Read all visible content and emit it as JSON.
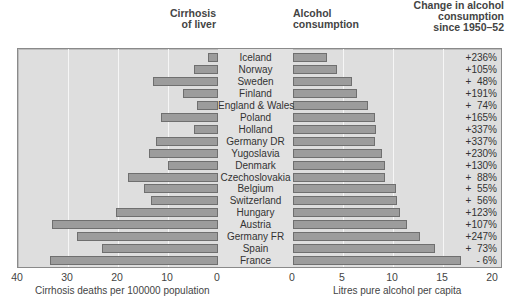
{
  "chart_data": {
    "type": "bar",
    "categories": [
      "Iceland",
      "Norway",
      "Sweden",
      "Finland",
      "England & Wales",
      "Poland",
      "Holland",
      "Germany DR",
      "Yugoslavia",
      "Denmark",
      "Czechoslovakia",
      "Belgium",
      "Switzerland",
      "Hungary",
      "Austria",
      "Germany FR",
      "Spain",
      "France"
    ],
    "series": [
      {
        "name": "Cirrhosis of liver",
        "unit": "Cirrhosis deaths per 100000 population",
        "values": [
          2.0,
          4.8,
          13.0,
          7.0,
          4.2,
          11.4,
          4.8,
          12.4,
          13.8,
          10.0,
          18.0,
          14.8,
          13.4,
          20.4,
          33.2,
          28.2,
          23.2,
          33.6
        ]
      },
      {
        "name": "Alcohol consumption",
        "unit": "Litres pure alcohol per capita",
        "values": [
          3.4,
          4.4,
          5.9,
          6.4,
          7.5,
          8.2,
          8.3,
          8.2,
          8.9,
          9.2,
          9.2,
          10.3,
          10.4,
          10.7,
          11.4,
          12.7,
          14.2,
          16.8
        ]
      },
      {
        "name": "Change in alcohol consumption since 1950-52",
        "unit": "%",
        "values": [
          236,
          105,
          48,
          191,
          74,
          165,
          337,
          337,
          230,
          130,
          88,
          55,
          56,
          123,
          107,
          247,
          73,
          -6
        ]
      }
    ],
    "change_labels": [
      "+236%",
      "+105%",
      "+  48%",
      "+191%",
      "+  74%",
      "+165%",
      "+337%",
      "+337%",
      "+230%",
      "+130%",
      "+  88%",
      "+  55%",
      "+  56%",
      "+123%",
      "+107%",
      "+247%",
      "+  73%",
      "- 6%"
    ],
    "left_axis": {
      "label": "Cirrhosis deaths per 100000 population",
      "ticks": [
        "40",
        "30",
        "20",
        "10",
        "0"
      ],
      "range": [
        40,
        0
      ],
      "reversed": true
    },
    "right_axis": {
      "label": "Litres pure alcohol per capita",
      "ticks": [
        "0",
        "5",
        "10",
        "15",
        "20"
      ],
      "range": [
        0,
        20
      ]
    },
    "headers": {
      "cirrhosis": [
        "Cirrhosis",
        "of liver"
      ],
      "alcohol": [
        "Alcohol",
        "consumption"
      ],
      "change": [
        "Change in alcohol",
        "consumption",
        "since 1950–52"
      ]
    },
    "grid": true,
    "bar_color": "#9c9c9c",
    "panel_color": "#dedede"
  }
}
